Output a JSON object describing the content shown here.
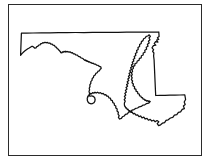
{
  "figure": {
    "type": "outline-map",
    "title": "",
    "caption": "",
    "labels": [],
    "text_content": "none",
    "background_color": "#ffffff",
    "frame": {
      "visible": true,
      "color": "#2b2b2b",
      "line_width_px": 1,
      "left_px": 8,
      "top_px": 4,
      "width_px": 194,
      "height_px": 152
    },
    "outline": {
      "stroke_color": "#101010",
      "fill_color": "#ffffff",
      "stroke_width_px": 1.25,
      "style": "line-art silhouette"
    },
    "bounds_px": {
      "x_min": 20,
      "x_max": 186,
      "y_min": 32,
      "y_max": 127
    },
    "features": [
      {
        "name": "western-panhandle",
        "description": "narrow wedge tapering to a point at the far west"
      },
      {
        "name": "northern-border",
        "description": "straight Mason-Dixon line running east across the top"
      },
      {
        "name": "potomac-river-border",
        "description": "irregular winding southern boundary from the panhandle southeast"
      },
      {
        "name": "chesapeake-bay",
        "description": "deep ragged inlet splitting the state into western shore and eastern shore"
      },
      {
        "name": "eastern-border",
        "description": "straight vertical Delaware line on the right edge"
      },
      {
        "name": "southeast-tip",
        "description": "pointed lower Delmarva peninsula corner"
      }
    ],
    "path_data": "M 20.6 55.3 L 21.4 33.2 L 26.5 33.1 L 33.0 33.0 L 41.5 32.9 L 50.0 32.8 L 58.5 32.7 L 67.0 32.6 L 75.5 32.5 L 84.0 32.5 L 92.5 32.4 L 101.0 32.4 L 109.5 32.3 L 118.0 32.3 L 126.5 32.2 L 135.0 32.2 L 143.5 32.1 L 152.0 32.1 L 158.8 32.0 L 159.1 36.6 L 157.4 37.8 L 158.7 39.4 L 156.6 40.0 L 157.9 42.1 L 155.6 41.6 L 154.2 43.6 L 155.8 45.2 L 153.4 45.6 L 152.0 47.9 L 153.6 49.6 L 152.6 51.4 L 153.9 53.0 L 153.6 56.0 L 154.1 60.0 L 154.3 64.5 L 154.5 69.0 L 154.7 73.5 L 154.9 78.0 L 155.1 82.5 L 155.3 87.0 L 155.5 91.5 L 155.7 95.5 L 160.0 95.4 L 165.0 95.3 L 170.0 95.2 L 175.0 95.1 L 180.0 95.0 L 184.8 94.9 L 185.6 99.5 L 184.2 102.0 L 185.2 104.5 L 183.4 106.0 L 184.4 108.6 L 182.2 109.4 L 180.6 111.8 L 178.4 112.4 L 176.8 114.6 L 174.4 115.2 L 172.8 117.4 L 170.4 118.0 L 168.2 119.8 L 166.0 120.4 L 164.6 122.6 L 162.4 123.2 L 160.6 124.8 L 158.6 125.6 L 157.2 123.6 L 158.8 121.8 L 157.0 120.6 L 155.2 121.8 L 153.6 120.2 L 151.8 121.0 L 150.2 119.4 L 148.4 120.2 L 147.0 118.4 L 145.2 119.0 L 143.8 117.2 L 142.0 117.8 L 140.6 116.0 L 139.0 116.6 L 137.6 114.8 L 136.0 115.2 L 134.6 113.4 L 133.4 113.8 L 132.0 112.0 L 131.0 112.4 L 129.8 110.6 L 129.0 111.0 L 128.0 109.2 L 127.4 109.6 L 126.4 107.8 L 126.0 108.2 L 125.2 106.4 L 125.0 106.8 L 124.4 105.0 L 124.4 103.0 L 125.2 101.2 L 124.2 99.6 L 125.4 98.0 L 124.4 96.4 L 125.8 95.0 L 124.8 93.4 L 126.4 92.0 L 125.4 90.4 L 127.0 89.0 L 126.0 87.4 L 127.6 86.2 L 126.6 84.6 L 128.2 83.4 L 127.2 81.8 L 128.8 80.6 L 127.8 79.0 L 129.4 77.8 L 128.4 76.2 L 130.0 75.0 L 129.0 73.4 L 130.6 72.2 L 129.8 70.6 L 131.4 69.4 L 130.6 67.8 L 132.2 66.6 L 131.4 65.0 L 133.0 63.8 L 132.2 62.2 L 133.8 61.0 L 133.2 59.4 L 134.8 58.2 L 134.2 56.6 L 135.8 55.4 L 135.4 53.6 L 137.0 52.4 L 136.6 50.6 L 138.2 49.4 L 138.0 47.6 L 139.6 46.4 L 139.6 44.6 L 141.2 43.4 L 141.4 41.6 L 143.0 40.6 L 143.6 38.8 L 145.2 38.0 L 146.2 36.4 L 147.8 36.0 L 149.2 34.8 L 150.4 36.4 L 149.0 38.0 L 150.0 39.8 L 148.4 41.2 L 149.2 43.0 L 147.4 44.2 L 148.0 46.2 L 146.2 47.2 L 146.6 49.2 L 144.8 50.2 L 145.0 52.2 L 143.2 53.0 L 143.2 55.0 L 141.4 55.8 L 141.2 57.8 L 139.4 58.4 L 139.0 60.4 L 137.2 61.0 L 136.8 63.0 L 135.0 63.6 L 134.8 65.6 L 133.2 66.4 L 133.4 68.4 L 132.0 69.6 L 132.6 71.4 L 131.4 72.8 L 132.2 74.6 L 131.2 76.2 L 132.2 77.8 L 131.4 79.6 L 132.6 81.0 L 132.0 82.8 L 133.4 84.0 L 133.0 85.8 L 134.6 86.8 L 134.4 88.6 L 136.0 89.4 L 136.0 91.2 L 137.6 91.8 L 137.8 93.6 L 139.2 94.0 L 139.6 95.8 L 140.8 96.0 L 141.4 97.6 L 142.4 97.6 L 143.2 99.2 L 144.0 99.0 L 145.0 100.4 L 145.6 100.0 L 146.8 101.2 L 147.2 100.6 L 148.6 101.6 L 148.8 100.8 L 150.2 101.6 L 148.6 103.2 L 146.6 103.6 L 144.8 104.8 L 142.8 105.2 L 141.2 106.4 L 139.2 106.8 L 137.6 108.0 L 135.6 108.4 L 134.0 109.6 L 132.0 110.2 L 130.6 111.6 L 128.6 112.2 L 127.4 113.8 L 125.4 114.4 L 124.2 116.0 L 122.4 116.8 L 121.4 118.4 L 119.6 119.0 L 118.4 117.4 L 119.2 115.6 L 118.0 114.2 L 118.4 112.2 L 117.0 111.0 L 117.2 109.0 L 115.8 108.0 L 115.8 106.0 L 114.4 105.2 L 114.2 103.2 L 112.8 102.6 L 112.4 100.6 L 111.0 100.2 L 110.4 98.2 L 109.0 98.0 L 108.2 96.2 L 106.8 96.2 L 105.8 94.6 L 104.4 94.8 L 103.2 93.4 L 101.8 93.8 L 100.4 92.6 L 99.0 93.2 L 97.6 92.2 L 96.2 93.0 L 95.0 92.2 L 93.8 93.2 L 92.6 92.6 L 91.6 93.8 L 90.6 93.4 L 89.8 94.8 L 89.0 94.6 L 88.4 96.2 L 87.8 96.2 L 87.6 97.8 L 87.2 98.0 L 87.4 99.6 L 87.2 100.0 L 87.8 101.4 L 87.8 101.8 L 88.8 102.8 L 89.0 103.2 L 90.4 103.6 L 90.8 103.8 L 92.2 103.6 L 92.6 103.6 L 93.8 102.8 L 94.0 102.8 L 94.8 101.4 L 94.8 101.2 L 95.2 99.6 L 95.0 99.4 L 94.8 97.8 L 94.4 97.6 L 93.6 96.4 L 93.0 96.4 L 91.8 95.8 L 91.2 96.0 L 90.0 96.0 L 89.8 96.2 L 89.2 95.0 L 89.6 93.2 L 89.0 91.6 L 89.6 89.8 L 89.2 88.2 L 90.0 86.6 L 89.8 84.8 L 90.8 83.4 L 90.8 81.6 L 92.0 80.4 L 92.2 78.6 L 93.4 77.6 L 93.8 75.8 L 95.2 75.0 L 95.8 73.4 L 97.2 72.8 L 98.0 71.2 L 99.4 70.8 L 100.2 69.2 L 101.2 68.4 L 100.8 66.8 L 99.4 66.4 L 98.2 65.4 L 96.8 65.2 L 95.6 64.2 L 94.4 64.2 L 93.2 63.2 L 92.2 63.4 L 91.0 62.4 L 90.2 62.6 L 89.2 61.6 L 88.6 62.0 L 87.6 61.0 L 87.2 61.4 L 86.4 60.4 L 86.2 61.0 L 85.4 60.0 L 85.0 60.4 L 83.8 59.6 L 82.8 58.4 L 81.2 58.0 L 80.0 56.8 L 78.4 56.4 L 77.4 55.2 L 75.8 55.0 L 74.8 53.8 L 73.4 53.8 L 72.4 52.6 L 71.2 52.8 L 70.0 51.8 L 69.0 52.2 L 67.8 51.4 L 67.0 52.0 L 65.8 51.2 L 65.2 52.0 L 64.0 51.4 L 63.6 52.2 L 62.4 51.8 L 62.0 52.8 L 60.8 52.6 L 60.2 51.4 L 59.2 50.6 L 58.4 49.2 L 57.2 48.6 L 56.4 47.2 L 55.2 46.8 L 54.4 45.4 L 53.0 45.2 L 52.2 44.0 L 50.8 44.0 L 49.8 43.0 L 48.4 43.2 L 47.4 42.4 L 46.0 42.8 L 45.0 42.2 L 43.8 43.0 L 42.8 42.6 L 41.8 43.6 L 40.8 43.6 L 40.0 44.8 L 38.8 45.0 L 38.0 46.2 L 36.8 46.6 L 36.0 47.8 L 34.8 48.2 L 33.8 47.2 L 32.8 46.4 L 31.6 46.4 L 30.4 47.2 L 29.2 48.0 L 27.8 48.8 L 26.4 49.8 L 25.0 50.8 L 23.6 52.0 L 22.2 53.4 Z"
  }
}
